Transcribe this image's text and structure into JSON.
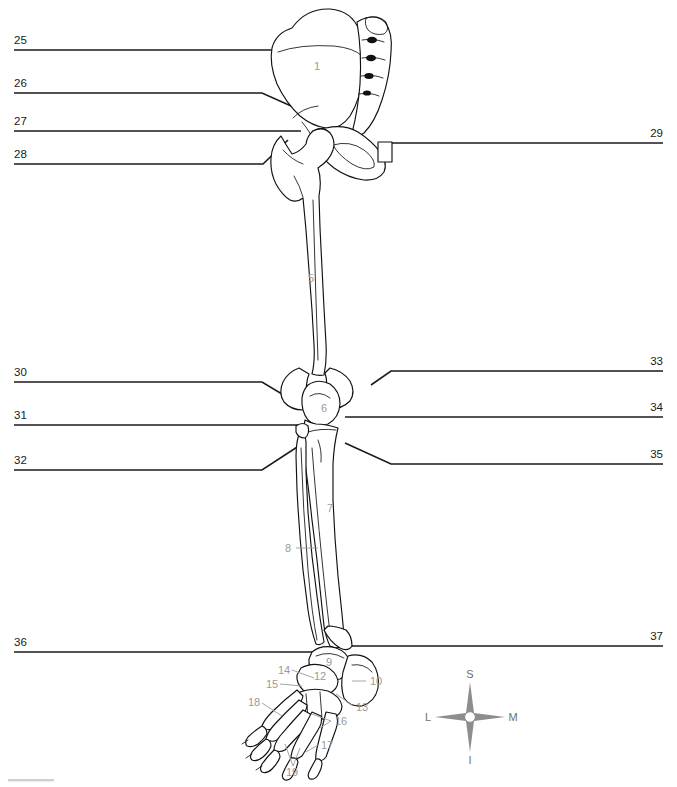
{
  "left_callouts": [
    {
      "number": "25",
      "y": 44
    },
    {
      "number": "26",
      "y": 87
    },
    {
      "number": "27",
      "y": 125
    },
    {
      "number": "28",
      "y": 158
    },
    {
      "number": "30",
      "y": 376
    },
    {
      "number": "31",
      "y": 419
    },
    {
      "number": "32",
      "y": 464
    },
    {
      "number": "36",
      "y": 646
    }
  ],
  "right_callouts": [
    {
      "number": "29",
      "y": 137
    },
    {
      "number": "33",
      "y": 365
    },
    {
      "number": "34",
      "y": 411
    },
    {
      "number": "35",
      "y": 458
    },
    {
      "number": "37",
      "y": 640
    }
  ],
  "interior_numbers": [
    {
      "number": "1",
      "x": 317,
      "y": 66
    },
    {
      "number": "5",
      "x": 311,
      "y": 278
    },
    {
      "number": "6",
      "x": 324,
      "y": 408
    },
    {
      "number": "7",
      "x": 330,
      "y": 508
    },
    {
      "number": "8",
      "x": 288,
      "y": 548
    },
    {
      "number": "9",
      "x": 329,
      "y": 662
    },
    {
      "number": "10",
      "x": 374,
      "y": 681
    },
    {
      "number": "12",
      "x": 320,
      "y": 676
    },
    {
      "number": "13",
      "x": 360,
      "y": 707
    },
    {
      "number": "14",
      "x": 284,
      "y": 670
    },
    {
      "number": "15",
      "x": 272,
      "y": 684
    },
    {
      "number": "16",
      "x": 339,
      "y": 721
    },
    {
      "number": "17",
      "x": 325,
      "y": 745
    },
    {
      "number": "18",
      "x": 254,
      "y": 702
    },
    {
      "number": "19",
      "x": 292,
      "y": 772
    }
  ],
  "compass": {
    "superior": "S",
    "inferior": "I",
    "lateral": "L",
    "medial": "M",
    "center_x": 470,
    "center_y": 717
  },
  "colors": {
    "leader_line": "#1a1a1a",
    "callout_number": "#1a1a1a",
    "interior_number": "#9a9a9a",
    "bone_outline": "#111111",
    "compass": "#8d8d8d",
    "background": "#ffffff"
  }
}
